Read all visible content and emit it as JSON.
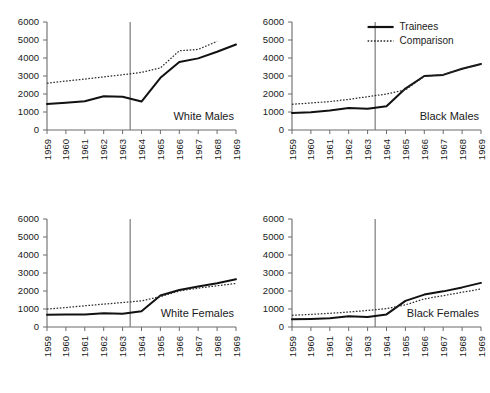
{
  "figure": {
    "background": "#ffffff",
    "panel_order": [
      "white_males",
      "black_males",
      "white_females",
      "black_females"
    ]
  },
  "legend": {
    "position": "top-right panel, inside upper area",
    "entries": [
      {
        "label": "Trainees",
        "style": "solid",
        "color": "#111111"
      },
      {
        "label": "Comparison",
        "style": "dotted",
        "color": "#2b2b2b"
      }
    ]
  },
  "axes": {
    "y_ticks": [
      "0",
      "1000",
      "2000",
      "3000",
      "4000",
      "5000",
      "6000"
    ],
    "y_tick_values": [
      0,
      1000,
      2000,
      3000,
      4000,
      5000,
      6000
    ],
    "ylim": [
      0,
      6000
    ],
    "x_ticks": [
      "1959",
      "1960",
      "1961",
      "1962",
      "1963",
      "1964",
      "1965",
      "1966",
      "1967",
      "1968",
      "1969"
    ],
    "x_tick_values": [
      1959,
      1960,
      1961,
      1962,
      1963,
      1964,
      1965,
      1966,
      1967,
      1968,
      1969
    ],
    "xlim": [
      1959,
      1969
    ],
    "xlabel": "",
    "ylabel": "",
    "grid": false,
    "vertical_reference_line_at": 1963.4
  },
  "chart_data": [
    {
      "type": "line",
      "title": "White Males",
      "xlabel": "",
      "ylabel": "",
      "xlim": [
        1959,
        1969
      ],
      "ylim": [
        0,
        6000
      ],
      "grid": false,
      "legend_position": "none",
      "x": [
        1959,
        1960,
        1961,
        1962,
        1963,
        1964,
        1965,
        1966,
        1967,
        1968,
        1969
      ],
      "annotations": [
        {
          "type": "vline",
          "x": 1963.4,
          "label": ""
        }
      ],
      "series": [
        {
          "name": "Trainees",
          "style": "solid",
          "x": [
            1959,
            1960,
            1961,
            1962,
            1963,
            1964,
            1965,
            1966,
            1967,
            1968,
            1969
          ],
          "values": [
            1450,
            1520,
            1600,
            1870,
            1850,
            1580,
            2900,
            3780,
            3980,
            4350,
            4750
          ]
        },
        {
          "name": "Comparison",
          "style": "dotted",
          "x": [
            1959,
            1960,
            1961,
            1962,
            1963,
            1964,
            1965,
            1966,
            1967,
            1968
          ],
          "values": [
            2600,
            2720,
            2830,
            2950,
            3070,
            3200,
            3450,
            4400,
            4480,
            4920
          ]
        }
      ]
    },
    {
      "type": "line",
      "title": "Black Males",
      "xlabel": "",
      "ylabel": "",
      "xlim": [
        1959,
        1969
      ],
      "ylim": [
        0,
        6000
      ],
      "grid": false,
      "legend_position": "upper-right",
      "x": [
        1959,
        1960,
        1961,
        1962,
        1963,
        1964,
        1965,
        1966,
        1967,
        1968,
        1969
      ],
      "annotations": [
        {
          "type": "vline",
          "x": 1963.4,
          "label": ""
        }
      ],
      "series": [
        {
          "name": "Trainees",
          "style": "solid",
          "x": [
            1959,
            1960,
            1961,
            1962,
            1963,
            1964,
            1965,
            1966,
            1967,
            1968,
            1969
          ],
          "values": [
            950,
            990,
            1080,
            1220,
            1180,
            1320,
            2300,
            3000,
            3060,
            3400,
            3670
          ]
        },
        {
          "name": "Comparison",
          "style": "dotted",
          "x": [
            1959,
            1960,
            1961,
            1962,
            1963,
            1964,
            1965,
            1966,
            1967,
            1968,
            1969
          ],
          "values": [
            1430,
            1500,
            1580,
            1700,
            1850,
            2000,
            2230,
            2980,
            3080,
            3400,
            3650
          ]
        }
      ]
    },
    {
      "type": "line",
      "title": "White Females",
      "xlabel": "",
      "ylabel": "",
      "xlim": [
        1959,
        1969
      ],
      "ylim": [
        0,
        6000
      ],
      "grid": false,
      "legend_position": "none",
      "x": [
        1959,
        1960,
        1961,
        1962,
        1963,
        1964,
        1965,
        1966,
        1967,
        1968,
        1969
      ],
      "annotations": [
        {
          "type": "vline",
          "x": 1963.4,
          "label": ""
        }
      ],
      "series": [
        {
          "name": "Trainees",
          "style": "solid",
          "x": [
            1959,
            1960,
            1961,
            1962,
            1963,
            1964,
            1965,
            1966,
            1967,
            1968,
            1969
          ],
          "values": [
            680,
            690,
            700,
            760,
            730,
            880,
            1750,
            2060,
            2250,
            2430,
            2650
          ]
        },
        {
          "name": "Comparison",
          "style": "dotted",
          "x": [
            1959,
            1960,
            1961,
            1962,
            1963,
            1964,
            1965,
            1966,
            1967,
            1968,
            1969
          ],
          "values": [
            1000,
            1080,
            1180,
            1270,
            1360,
            1450,
            1690,
            2000,
            2160,
            2290,
            2420
          ]
        }
      ]
    },
    {
      "type": "line",
      "title": "Black Females",
      "xlabel": "",
      "ylabel": "",
      "xlim": [
        1959,
        1969
      ],
      "ylim": [
        0,
        6000
      ],
      "grid": false,
      "legend_position": "none",
      "x": [
        1959,
        1960,
        1961,
        1962,
        1963,
        1964,
        1965,
        1966,
        1967,
        1968,
        1969
      ],
      "annotations": [
        {
          "type": "vline",
          "x": 1963.4,
          "label": ""
        }
      ],
      "series": [
        {
          "name": "Trainees",
          "style": "solid",
          "x": [
            1959,
            1960,
            1961,
            1962,
            1963,
            1964,
            1965,
            1966,
            1967,
            1968,
            1969
          ],
          "values": [
            430,
            450,
            480,
            600,
            560,
            700,
            1450,
            1800,
            1980,
            2200,
            2450
          ]
        },
        {
          "name": "Comparison",
          "style": "dotted",
          "x": [
            1959,
            1960,
            1961,
            1962,
            1963,
            1964,
            1965,
            1966,
            1967,
            1968,
            1969
          ],
          "values": [
            650,
            700,
            760,
            830,
            920,
            1020,
            1230,
            1560,
            1740,
            1930,
            2110
          ]
        }
      ]
    }
  ]
}
